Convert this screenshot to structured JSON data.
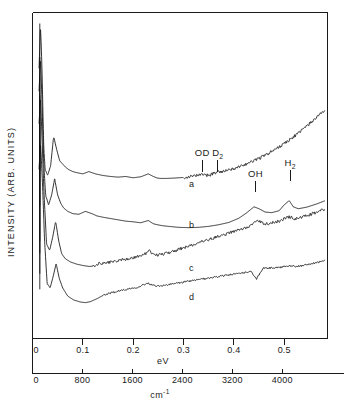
{
  "figure": {
    "type": "spectra-figure",
    "ylabel": "INTENSITY (ARB. UNITS)",
    "background": "#ffffff",
    "line_color": "#111111"
  },
  "axes": {
    "ev": {
      "title": "eV",
      "ticks": [
        "0",
        "0.1",
        "0.2",
        "0.3",
        "0.4",
        "0.5"
      ],
      "tick_values": [
        0,
        0.1,
        0.2,
        0.3,
        0.4,
        0.5
      ],
      "range": [
        0,
        0.586
      ]
    },
    "wavenumber": {
      "title": "cm",
      "title_sup": "-1",
      "ticks": [
        "0",
        "800",
        "1600",
        "2400",
        "3200",
        "4000"
      ],
      "tick_values": [
        0,
        800,
        1600,
        2400,
        3200,
        4000
      ],
      "range": [
        0,
        4725
      ]
    }
  },
  "peak_labels": [
    {
      "name": "OD",
      "sub": "",
      "ev": 0.337
    },
    {
      "name": "D",
      "sub": "2",
      "ev": 0.368
    },
    {
      "name": "OH",
      "sub": "",
      "ev": 0.443
    },
    {
      "name": "H",
      "sub": "2",
      "ev": 0.512
    }
  ],
  "curve_labels": [
    {
      "id": "a",
      "label": "a"
    },
    {
      "id": "b",
      "label": "b"
    },
    {
      "id": "c",
      "label": "c"
    },
    {
      "id": "d",
      "label": "d"
    }
  ],
  "chart_data": {
    "type": "line",
    "title": "",
    "subtitle": "",
    "xlabel": "eV",
    "xlabel_secondary": "cm-1",
    "ylabel": "INTENSITY (ARB. UNITS)",
    "xlim": [
      0,
      0.586
    ],
    "xlim_secondary": [
      0,
      4725
    ],
    "ylim": [
      0,
      1
    ],
    "grid": false,
    "legend": "inline-curve-labels",
    "annotations": [
      {
        "text": "OD",
        "x_ev": 0.337,
        "series": "a"
      },
      {
        "text": "D2",
        "x_ev": 0.368,
        "series": "a"
      },
      {
        "text": "OH",
        "x_ev": 0.443,
        "series": "b"
      },
      {
        "text": "H2",
        "x_ev": 0.512,
        "series": "b"
      },
      {
        "text": "a",
        "x_ev": 0.287,
        "series": "a"
      },
      {
        "text": "b",
        "x_ev": 0.287,
        "series": "b"
      },
      {
        "text": "c",
        "x_ev": 0.287,
        "series": "c"
      },
      {
        "text": "d",
        "x_ev": 0.287,
        "series": "d"
      }
    ],
    "series": [
      {
        "name": "a",
        "description": "top spectrum, sharp low-energy phonon peak, broad rise at high energy, weak OD and D2 lines",
        "x": [
          0.013,
          0.016,
          0.019,
          0.022,
          0.025,
          0.03,
          0.036,
          0.042,
          0.048,
          0.054,
          0.06,
          0.066,
          0.072,
          0.08,
          0.09,
          0.1,
          0.112,
          0.125,
          0.14,
          0.155,
          0.17,
          0.185,
          0.2,
          0.215,
          0.23,
          0.24,
          0.248,
          0.255,
          0.265,
          0.28,
          0.3,
          0.32,
          0.337,
          0.35,
          0.368,
          0.38,
          0.4,
          0.42,
          0.44,
          0.46,
          0.48,
          0.5,
          0.52,
          0.54,
          0.56,
          0.58
        ],
        "y": [
          0.83,
          0.96,
          0.82,
          0.6,
          0.52,
          0.5,
          0.53,
          0.62,
          0.58,
          0.545,
          0.535,
          0.525,
          0.518,
          0.512,
          0.508,
          0.505,
          0.512,
          0.505,
          0.5,
          0.497,
          0.495,
          0.497,
          0.493,
          0.496,
          0.505,
          0.497,
          0.492,
          0.491,
          0.491,
          0.492,
          0.494,
          0.497,
          0.503,
          0.5,
          0.512,
          0.512,
          0.521,
          0.532,
          0.546,
          0.56,
          0.578,
          0.598,
          0.62,
          0.645,
          0.672,
          0.7
        ]
      },
      {
        "name": "b",
        "description": "second spectrum, strong OH band near 0.44 eV and sharp H2 line near 0.51 eV",
        "x": [
          0.013,
          0.016,
          0.019,
          0.022,
          0.026,
          0.032,
          0.038,
          0.044,
          0.05,
          0.056,
          0.062,
          0.07,
          0.08,
          0.092,
          0.105,
          0.118,
          0.128,
          0.14,
          0.155,
          0.17,
          0.185,
          0.2,
          0.215,
          0.23,
          0.24,
          0.248,
          0.258,
          0.27,
          0.29,
          0.31,
          0.33,
          0.35,
          0.37,
          0.39,
          0.41,
          0.425,
          0.44,
          0.45,
          0.462,
          0.475,
          0.49,
          0.5,
          0.51,
          0.518,
          0.528,
          0.545,
          0.565,
          0.58
        ],
        "y": [
          0.76,
          0.86,
          0.72,
          0.55,
          0.44,
          0.41,
          0.44,
          0.49,
          0.44,
          0.415,
          0.4,
          0.39,
          0.383,
          0.381,
          0.39,
          0.383,
          0.376,
          0.372,
          0.368,
          0.364,
          0.36,
          0.358,
          0.355,
          0.362,
          0.352,
          0.349,
          0.346,
          0.344,
          0.341,
          0.34,
          0.341,
          0.344,
          0.349,
          0.356,
          0.369,
          0.385,
          0.404,
          0.398,
          0.388,
          0.386,
          0.392,
          0.41,
          0.423,
          0.404,
          0.398,
          0.403,
          0.413,
          0.422
        ]
      },
      {
        "name": "c",
        "description": "third spectrum, monotonic rise with noise, weak features near 0.24 and 0.45 eV",
        "x": [
          0.013,
          0.016,
          0.019,
          0.023,
          0.028,
          0.034,
          0.04,
          0.046,
          0.052,
          0.058,
          0.065,
          0.075,
          0.088,
          0.1,
          0.112,
          0.122,
          0.132,
          0.145,
          0.16,
          0.18,
          0.2,
          0.22,
          0.232,
          0.242,
          0.25,
          0.262,
          0.28,
          0.3,
          0.32,
          0.34,
          0.36,
          0.38,
          0.4,
          0.42,
          0.435,
          0.448,
          0.458,
          0.47,
          0.49,
          0.51,
          0.52,
          0.535,
          0.555,
          0.58
        ],
        "y": [
          0.66,
          0.74,
          0.61,
          0.44,
          0.29,
          0.27,
          0.31,
          0.36,
          0.3,
          0.26,
          0.245,
          0.235,
          0.228,
          0.224,
          0.221,
          0.222,
          0.23,
          0.232,
          0.236,
          0.242,
          0.248,
          0.256,
          0.268,
          0.258,
          0.256,
          0.26,
          0.268,
          0.278,
          0.288,
          0.298,
          0.308,
          0.318,
          0.328,
          0.338,
          0.348,
          0.362,
          0.352,
          0.352,
          0.36,
          0.374,
          0.366,
          0.372,
          0.382,
          0.396
        ]
      },
      {
        "name": "d",
        "description": "bottom spectrum, shallow dip near 0.10 eV, step feature near 0.45 eV",
        "x": [
          0.013,
          0.016,
          0.02,
          0.024,
          0.029,
          0.035,
          0.041,
          0.047,
          0.053,
          0.06,
          0.07,
          0.082,
          0.095,
          0.105,
          0.115,
          0.128,
          0.14,
          0.155,
          0.172,
          0.19,
          0.21,
          0.228,
          0.24,
          0.25,
          0.262,
          0.28,
          0.3,
          0.32,
          0.34,
          0.36,
          0.38,
          0.4,
          0.42,
          0.435,
          0.445,
          0.452,
          0.458,
          0.47,
          0.49,
          0.51,
          0.525,
          0.545,
          0.565,
          0.58
        ],
        "y": [
          0.52,
          0.6,
          0.47,
          0.3,
          0.17,
          0.155,
          0.19,
          0.23,
          0.185,
          0.155,
          0.13,
          0.118,
          0.112,
          0.11,
          0.113,
          0.122,
          0.132,
          0.14,
          0.146,
          0.152,
          0.158,
          0.17,
          0.164,
          0.161,
          0.163,
          0.168,
          0.173,
          0.178,
          0.183,
          0.188,
          0.193,
          0.197,
          0.202,
          0.205,
          0.182,
          0.2,
          0.216,
          0.216,
          0.218,
          0.224,
          0.221,
          0.226,
          0.233,
          0.24
        ]
      }
    ]
  }
}
